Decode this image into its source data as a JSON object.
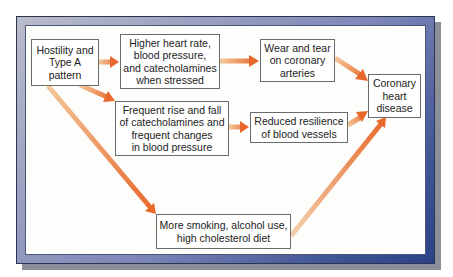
{
  "diagram": {
    "type": "flowchart",
    "colors": {
      "arrow_start": "#f3c79b",
      "arrow_end": "#e8672a",
      "frame_light": "#b9bcc8",
      "frame_dark": "#2b4286",
      "box_border": "#6b6b6b",
      "panel_bg": "#fdfdfb"
    },
    "nodes": [
      {
        "id": "hostility",
        "label": "Hostility and\nType A\npattern"
      },
      {
        "id": "higher_hr",
        "label": "Higher heart rate,\nblood pressure,\nand catecholamines\nwhen stressed"
      },
      {
        "id": "wear_tear",
        "label": "Wear and tear\non coronary\narteries"
      },
      {
        "id": "chd",
        "label": "Coronary\nheart\ndisease"
      },
      {
        "id": "frequent_rise",
        "label": "Frequent rise and fall\nof catecholamines and\nfrequent changes\nin blood pressure"
      },
      {
        "id": "reduced_resilience",
        "label": "Reduced resilience\nof blood vessels"
      },
      {
        "id": "smoking",
        "label": "More smoking, alcohol use,\nhigh cholesterol diet"
      }
    ],
    "edges": [
      {
        "from": "hostility",
        "to": "higher_hr"
      },
      {
        "from": "hostility",
        "to": "frequent_rise"
      },
      {
        "from": "hostility",
        "to": "smoking"
      },
      {
        "from": "higher_hr",
        "to": "wear_tear"
      },
      {
        "from": "wear_tear",
        "to": "chd"
      },
      {
        "from": "frequent_rise",
        "to": "reduced_resilience"
      },
      {
        "from": "reduced_resilience",
        "to": "chd"
      },
      {
        "from": "smoking",
        "to": "chd"
      }
    ]
  }
}
